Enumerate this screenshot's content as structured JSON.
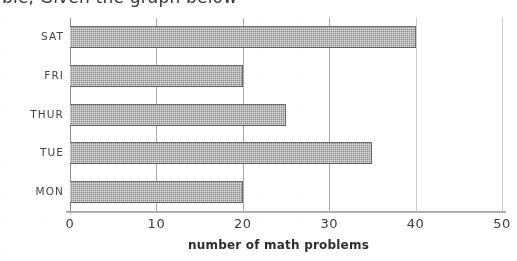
{
  "page": {
    "cut_off_text_fragment": "ble, Given the graph below"
  },
  "chart_data": {
    "type": "bar",
    "orientation": "horizontal",
    "title": "",
    "xlabel": "number of math problems",
    "ylabel": "",
    "categories": [
      "SAT",
      "FRI",
      "THUR",
      "TUE",
      "MON"
    ],
    "values": [
      40,
      20,
      25,
      35,
      20
    ],
    "xlim": [
      0,
      50
    ],
    "xticks": [
      "0",
      "10",
      "20",
      "30",
      "40",
      "50"
    ],
    "grid": true,
    "legend": null,
    "bar_color": "#8e8e8e",
    "axis_color": "#8d8d8d"
  }
}
